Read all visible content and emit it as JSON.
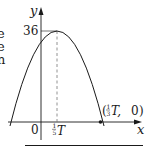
{
  "figure": {
    "axes": {
      "x_label": "x",
      "y_label": "y",
      "origin_label": "0"
    },
    "vertex": {
      "y_value_label": "36",
      "x_tick_numerator": "1",
      "x_tick_denominator": "5",
      "x_tick_suffix": "T"
    },
    "root": {
      "label_open": "(",
      "numerator": "1",
      "denominator": "3",
      "suffix": "T,",
      "y_value": "0",
      "label_close": ")"
    },
    "clipped_text_fragments": [
      "e",
      "e",
      "n"
    ],
    "colors": {
      "ink": "#1a1a1a",
      "dashed": "#777777"
    }
  }
}
